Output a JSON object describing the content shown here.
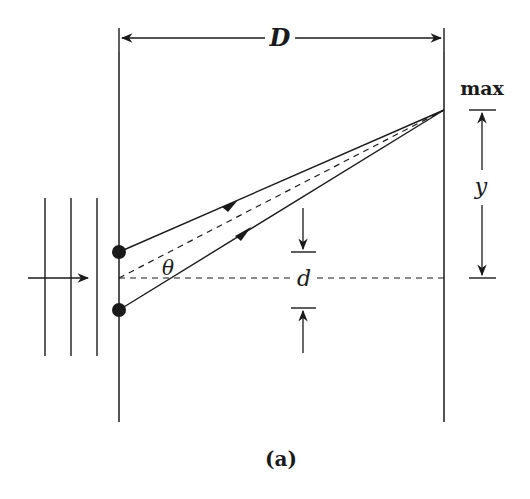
{
  "diagram": {
    "labels": {
      "distance": "D",
      "maximum": "max",
      "offset": "y",
      "slit_separation": "d",
      "angle": "θ",
      "caption": "(a)"
    },
    "colors": {
      "stroke": "#1a1a1a",
      "background": "#ffffff"
    }
  }
}
